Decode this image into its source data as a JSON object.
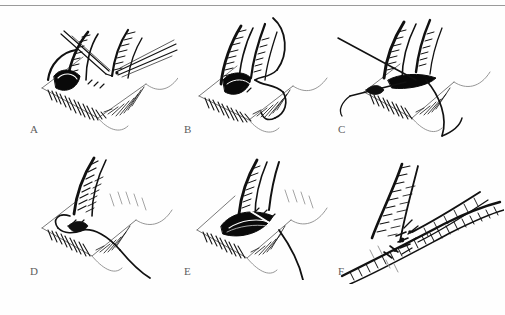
{
  "figure": {
    "kind": "surgical-illustration-plate",
    "medium": "pen-and-ink stipple drawing",
    "background_color": "#fefefe",
    "ink_color": "#111111",
    "faint_ink_color": "#8f8f8f",
    "scan_border": {
      "present": true,
      "edge": "top",
      "color": "#9a9a9a"
    },
    "grid": {
      "rows": 2,
      "columns": 3,
      "panel_count": 6
    }
  },
  "panels": [
    {
      "id": "a",
      "label": "A",
      "caption_text": "A",
      "subject": "end-to-side vascular anastomosis: arteriotomy held open with two fine forceps",
      "instruments": [
        "fine-forceps-left",
        "fine-forceps-right"
      ],
      "features": [
        "graft-vessel",
        "host-vessel",
        "arteriotomy-opening",
        "hatched-shading"
      ]
    },
    {
      "id": "b",
      "label": "B",
      "caption_text": "B",
      "subject": "suture passed through vessel wall with needle and trailing suture tail",
      "instruments": [
        "curved-needle",
        "suture-strand"
      ],
      "features": [
        "graft-vessel",
        "host-vessel",
        "arteriotomy-opening",
        "suture-loop"
      ]
    },
    {
      "id": "c",
      "label": "C",
      "caption_text": "C",
      "subject": "two stay sutures placed at the heel and toe of the anastomosis",
      "instruments": [
        "suture-strand-upper",
        "suture-strand-lower"
      ],
      "features": [
        "graft-vessel",
        "host-vessel",
        "stay-suture-pair"
      ]
    },
    {
      "id": "d",
      "label": "D",
      "caption_text": "D",
      "subject": "running suture line along the near wall of the anastomosis",
      "instruments": [
        "suture-strand",
        "suture-loop"
      ],
      "features": [
        "graft-vessel",
        "host-vessel",
        "continuous-suture-line"
      ]
    },
    {
      "id": "e",
      "label": "E",
      "caption_text": "E",
      "subject": "far wall of anastomosis sutured, vessel lumen still visible",
      "instruments": [
        "suture-strand",
        "needle-tail"
      ],
      "features": [
        "graft-vessel",
        "host-vessel",
        "open-lumen",
        "suture-line"
      ]
    },
    {
      "id": "f",
      "label": "F",
      "caption_text": "F",
      "subject": "completed anastomosis with knotted suture ends, vessels patent",
      "instruments": [
        "knotted-suture-ends"
      ],
      "features": [
        "graft-vessel",
        "host-vessel",
        "completed-suture-line"
      ]
    }
  ]
}
